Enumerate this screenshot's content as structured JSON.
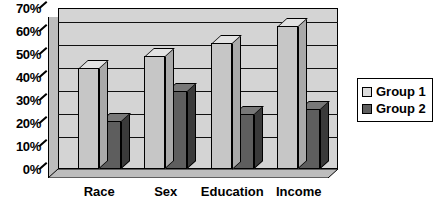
{
  "chart_data": {
    "type": "bar",
    "title": "",
    "subtitle": "",
    "xlabel": "",
    "ylabel": "",
    "categories": [
      "Race",
      "Sex",
      "Education",
      "Income"
    ],
    "series": [
      {
        "name": "Group 1",
        "values": [
          44,
          49,
          55,
          62
        ],
        "color": "#c6c6c6"
      },
      {
        "name": "Group 2",
        "values": [
          21,
          34,
          24,
          26
        ],
        "color": "#5e5e5e"
      }
    ],
    "ylim": [
      0,
      70
    ],
    "ytick_values": [
      0,
      10,
      20,
      30,
      40,
      50,
      60,
      70
    ],
    "ytick_labels": [
      "0%",
      "10%",
      "20%",
      "30%",
      "40%",
      "50%",
      "60%",
      "70%"
    ],
    "grid": true,
    "grid_axis": "y",
    "legend_position": "right",
    "style_3d": true,
    "plot_background": "#d4d4d4",
    "axis_color": "#000000"
  },
  "legend": {
    "entries": [
      {
        "label": "Group 1",
        "swatch": "light-gray-swatch"
      },
      {
        "label": "Group 2",
        "swatch": "dark-gray-swatch"
      }
    ]
  }
}
